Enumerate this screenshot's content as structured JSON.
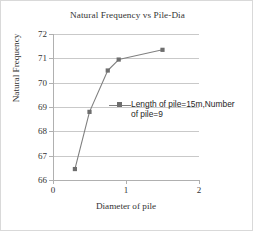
{
  "chart_data": {
    "type": "line",
    "title": "Natural Frequency vs Pile-Dia",
    "xlabel": "Diameter of pile",
    "ylabel": "Natural Frequency",
    "xlim": [
      0,
      2
    ],
    "ylim": [
      66,
      72
    ],
    "xticks": [
      "0",
      "1",
      "2"
    ],
    "yticks": [
      "66",
      "67",
      "68",
      "69",
      "70",
      "71",
      "72"
    ],
    "grid": "horizontal",
    "legend_position": "inside-center-right",
    "series": [
      {
        "name": "Length of pile=15m,Number of pile=9",
        "color": "#808080",
        "marker": "square",
        "x": [
          0.3,
          0.5,
          0.75,
          0.9,
          1.5
        ],
        "y": [
          66.45,
          68.8,
          70.5,
          70.95,
          71.35
        ]
      }
    ]
  },
  "legend": {
    "line1": "Length of pile=15m,Number",
    "line2": "of pile=9"
  }
}
